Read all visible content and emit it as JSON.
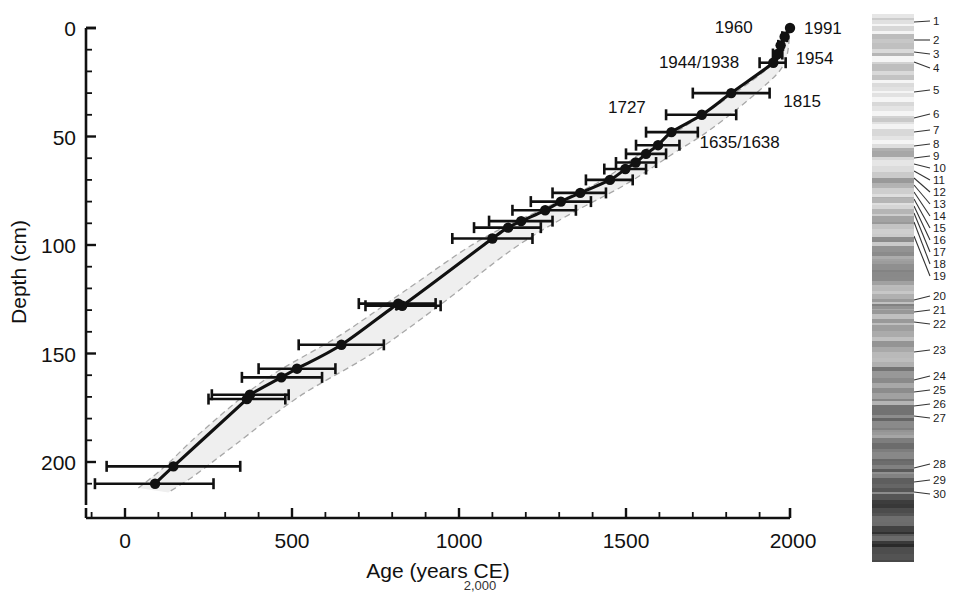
{
  "figure": {
    "type": "age-depth-model",
    "caption_fragment": "2,000"
  },
  "chart_data": {
    "type": "line",
    "title": "",
    "xlabel": "Age (years CE)",
    "ylabel": "Depth (cm)",
    "xlim": [
      -120,
      2050
    ],
    "ylim": [
      0,
      215
    ],
    "y_inverted": true,
    "grid": false,
    "legend": "none",
    "x_ticks_major": [
      0,
      500,
      1000,
      1500,
      2000
    ],
    "x_ticks_major_labels": [
      "0",
      "500",
      "1000",
      "1500",
      "2000"
    ],
    "x_tick_minor_step": 100,
    "y_ticks_major": [
      0,
      50,
      100,
      150,
      200
    ],
    "y_ticks_major_labels": [
      "0",
      "50",
      "100",
      "150",
      "200"
    ],
    "y_tick_minor_step": 10,
    "series": [
      {
        "name": "Age-depth model (median)",
        "style": "solid-black-line-with-filled-circles",
        "points": [
          {
            "age": 1991,
            "depth": 0,
            "err_low": 1991,
            "err_high": 1991
          },
          {
            "age": 1975,
            "depth": 4,
            "err_low": 1968,
            "err_high": 1982
          },
          {
            "age": 1963,
            "depth": 8,
            "err_low": 1956,
            "err_high": 1970
          },
          {
            "age": 1954,
            "depth": 12,
            "err_low": 1940,
            "err_high": 1968
          },
          {
            "age": 1941,
            "depth": 16,
            "err_low": 1900,
            "err_high": 1978
          },
          {
            "age": 1815,
            "depth": 30,
            "err_low": 1700,
            "err_high": 1930
          },
          {
            "age": 1727,
            "depth": 40,
            "err_low": 1620,
            "err_high": 1830
          },
          {
            "age": 1636,
            "depth": 48,
            "err_low": 1560,
            "err_high": 1715
          },
          {
            "age": 1596,
            "depth": 54,
            "err_low": 1530,
            "err_high": 1660
          },
          {
            "age": 1560,
            "depth": 58,
            "err_low": 1500,
            "err_high": 1620
          },
          {
            "age": 1529,
            "depth": 62,
            "err_low": 1470,
            "err_high": 1590
          },
          {
            "age": 1498,
            "depth": 65,
            "err_low": 1435,
            "err_high": 1560
          },
          {
            "age": 1452,
            "depth": 70,
            "err_low": 1380,
            "err_high": 1520
          },
          {
            "age": 1363,
            "depth": 76,
            "err_low": 1280,
            "err_high": 1440
          },
          {
            "age": 1305,
            "depth": 80,
            "err_low": 1215,
            "err_high": 1395
          },
          {
            "age": 1258,
            "depth": 84,
            "err_low": 1160,
            "err_high": 1350
          },
          {
            "age": 1186,
            "depth": 89,
            "err_low": 1090,
            "err_high": 1280
          },
          {
            "age": 1147,
            "depth": 92,
            "err_low": 1045,
            "err_high": 1245
          },
          {
            "age": 1100,
            "depth": 97,
            "err_low": 980,
            "err_high": 1220
          },
          {
            "age": 830,
            "depth": 128,
            "err_low": 720,
            "err_high": 945
          },
          {
            "age": 818,
            "depth": 127,
            "err_low": 700,
            "err_high": 930
          },
          {
            "age": 648,
            "depth": 146,
            "err_low": 520,
            "err_high": 775
          },
          {
            "age": 515,
            "depth": 157,
            "err_low": 400,
            "err_high": 630
          },
          {
            "age": 468,
            "depth": 161,
            "err_low": 350,
            "err_high": 590
          },
          {
            "age": 374,
            "depth": 169,
            "err_low": 260,
            "err_high": 490
          },
          {
            "age": 365,
            "depth": 171,
            "err_low": 250,
            "err_high": 480
          },
          {
            "age": 145,
            "depth": 202,
            "err_low": -55,
            "err_high": 345
          },
          {
            "age": 90,
            "depth": 210,
            "err_low": -90,
            "err_high": 265
          }
        ]
      }
    ],
    "uncertainty_envelope": {
      "name": "95% confidence envelope",
      "style": "light-gray-fill-with-dashed-gray-outline",
      "fill_color": "#efefef",
      "outline_color": "#a8a8a8",
      "upper_bound": [
        {
          "age": 1991,
          "depth": 0
        },
        {
          "age": 1948,
          "depth": 14
        },
        {
          "age": 1880,
          "depth": 24
        },
        {
          "age": 1690,
          "depth": 44
        },
        {
          "age": 1560,
          "depth": 56
        },
        {
          "age": 1430,
          "depth": 70
        },
        {
          "age": 1270,
          "depth": 82
        },
        {
          "age": 1060,
          "depth": 98
        },
        {
          "age": 830,
          "depth": 122
        },
        {
          "age": 640,
          "depth": 142
        },
        {
          "age": 420,
          "depth": 162
        },
        {
          "age": 230,
          "depth": 186
        },
        {
          "age": 120,
          "depth": 202
        },
        {
          "age": 40,
          "depth": 212
        }
      ],
      "lower_bound": [
        {
          "age": 1991,
          "depth": 0
        },
        {
          "age": 1975,
          "depth": 16
        },
        {
          "age": 1905,
          "depth": 28
        },
        {
          "age": 1760,
          "depth": 46
        },
        {
          "age": 1640,
          "depth": 58
        },
        {
          "age": 1500,
          "depth": 72
        },
        {
          "age": 1330,
          "depth": 86
        },
        {
          "age": 1160,
          "depth": 102
        },
        {
          "age": 940,
          "depth": 128
        },
        {
          "age": 740,
          "depth": 150
        },
        {
          "age": 520,
          "depth": 170
        },
        {
          "age": 330,
          "depth": 192
        },
        {
          "age": 210,
          "depth": 206
        },
        {
          "age": 130,
          "depth": 214
        }
      ]
    },
    "annotations": [
      {
        "text": "1991",
        "age": 1991,
        "depth": 0,
        "placement": "right"
      },
      {
        "text": "1960",
        "age": 1963,
        "depth": 8,
        "placement": "above-left"
      },
      {
        "text": "1954",
        "age": 1954,
        "depth": 12,
        "placement": "right"
      },
      {
        "text": "1944/1938",
        "age": 1941,
        "depth": 16,
        "placement": "left"
      },
      {
        "text": "1815",
        "age": 1815,
        "depth": 30,
        "placement": "right"
      },
      {
        "text": "1727",
        "age": 1727,
        "depth": 40,
        "placement": "left"
      },
      {
        "text": "1635/1638",
        "age": 1636,
        "depth": 48,
        "placement": "right"
      }
    ]
  },
  "core_image": {
    "name": "sediment-core-photograph",
    "description": "grayscale laminated sediment core photograph",
    "layer_labels": [
      "1",
      "2",
      "3",
      "4",
      "5",
      "6",
      "7",
      "8",
      "9",
      "10",
      "11",
      "12",
      "13",
      "14",
      "15",
      "16",
      "17",
      "18",
      "19",
      "20",
      "21",
      "22",
      "23",
      "24",
      "25",
      "26",
      "27",
      "28",
      "29",
      "30"
    ]
  }
}
